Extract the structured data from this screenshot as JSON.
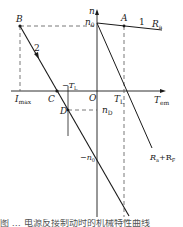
{
  "diagram": {
    "axes": {
      "y_label": "n",
      "x_label": "T",
      "x_label_sub": "em",
      "origin_label": "O"
    },
    "points": {
      "n0": {
        "label": "n",
        "sub": "0"
      },
      "A": {
        "label": "A"
      },
      "B": {
        "label": "B"
      },
      "C": {
        "label": "C"
      },
      "D": {
        "label": "D"
      },
      "neg_n0": {
        "label": "−n",
        "sub": "0"
      },
      "nD": {
        "label": "n",
        "sub": "D"
      },
      "TL": {
        "label": "T",
        "sub": "L"
      },
      "neg_TL": {
        "label": "−T",
        "sub": "L"
      },
      "Imax": {
        "label": "I",
        "sub": "max"
      }
    },
    "curves": [
      {
        "id": "1",
        "label": "1",
        "resistance_label": "R",
        "resistance_sub": "a"
      },
      {
        "id": "2",
        "label": "2"
      },
      {
        "id": "RaRF",
        "resistance_label": "R",
        "resistance_sub": "a",
        "plus": "+R",
        "plus_sub": "F"
      }
    ],
    "colors": {
      "line": "#1a1a1a",
      "dashed": "#555555"
    },
    "caption": "图 … 电源反接制动时的机械特性曲线"
  }
}
